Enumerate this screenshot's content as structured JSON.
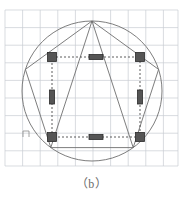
{
  "figure": {
    "caption": "（b）",
    "label_mark": "n",
    "background_color": "#ffffff"
  },
  "grid": {
    "color": "#c8cdd2",
    "stroke_width": 0.7,
    "spacing": 17.6,
    "x_start": 5,
    "x_end": 178,
    "y_start": 10,
    "y_end": 166,
    "vertical_lines": [
      5,
      22.6,
      40.2,
      57.8,
      75.4,
      93,
      110.6,
      128.2,
      145.8,
      163.4,
      178
    ],
    "horizontal_lines": [
      10,
      27.6,
      45.2,
      62.8,
      80.4,
      98,
      115.6,
      133.2,
      150.8,
      166
    ]
  },
  "circle": {
    "cx": 92,
    "cy": 91,
    "r": 70,
    "stroke": "#6e6e6e",
    "stroke_width": 0.9,
    "fill": "none"
  },
  "pentagon": {
    "stroke": "#6e6e6e",
    "stroke_width": 0.9,
    "fill": "none",
    "vertices": [
      {
        "name": "apex",
        "x": 92,
        "y": 21
      },
      {
        "name": "upper-right",
        "x": 158.6,
        "y": 69.4
      },
      {
        "name": "lower-right",
        "x": 133.2,
        "y": 147.6
      },
      {
        "name": "lower-left",
        "x": 50.8,
        "y": 147.6
      },
      {
        "name": "upper-left",
        "x": 25.4,
        "y": 69.4
      }
    ],
    "chords_from_apex": [
      {
        "to_x": 50.8,
        "to_y": 147.6
      },
      {
        "to_x": 133.2,
        "to_y": 147.6
      }
    ]
  },
  "dashed_rectangle": {
    "stroke": "#4a4a4a",
    "stroke_width": 0.9,
    "dash_pattern": "2,2",
    "x": 52,
    "y": 57,
    "width": 88,
    "height": 80
  },
  "markers": {
    "fill": "#555555",
    "stroke": "#2b2b2b",
    "stroke_width": 0.8,
    "items": [
      {
        "name": "marker-corner-top-left",
        "shape": "square",
        "cx": 52,
        "cy": 57,
        "w": 9,
        "h": 9
      },
      {
        "name": "marker-corner-top-right",
        "shape": "square",
        "cx": 140,
        "cy": 57,
        "w": 9,
        "h": 9
      },
      {
        "name": "marker-corner-bottom-left",
        "shape": "square",
        "cx": 52,
        "cy": 137,
        "w": 9,
        "h": 9
      },
      {
        "name": "marker-corner-bottom-right",
        "shape": "square",
        "cx": 140,
        "cy": 137,
        "w": 9,
        "h": 9
      },
      {
        "name": "marker-edge-top-center",
        "shape": "bar-horizontal",
        "cx": 96,
        "cy": 57,
        "w": 14,
        "h": 5
      },
      {
        "name": "marker-edge-bottom-center",
        "shape": "bar-horizontal",
        "cx": 96,
        "cy": 137,
        "w": 14,
        "h": 5
      },
      {
        "name": "marker-edge-left-middle",
        "shape": "bar-vertical",
        "cx": 52,
        "cy": 97,
        "w": 5,
        "h": 14
      },
      {
        "name": "marker-edge-right-middle",
        "shape": "bar-vertical",
        "cx": 140,
        "cy": 97,
        "w": 5,
        "h": 14
      }
    ]
  },
  "angle_mark": {
    "name": "angle-mark-n",
    "x": 23,
    "y": 131,
    "stroke": "#8a8a8a",
    "stroke_width": 0.8,
    "size": 6
  }
}
